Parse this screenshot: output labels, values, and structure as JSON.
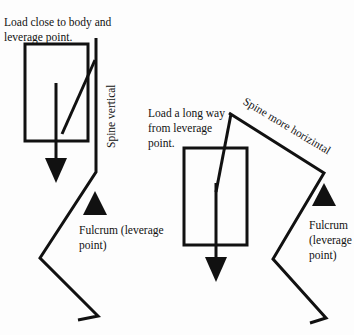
{
  "left_figure": {
    "load_label_line1": "Load close to body and",
    "load_label_line2": "leverage point.",
    "spine_label": "Spine vertical",
    "fulcrum_label_line1": "Fulcrum (leverage",
    "fulcrum_label_line2": "point)"
  },
  "right_figure": {
    "load_label_line1": "Load a long way",
    "load_label_line2": "from leverage",
    "load_label_line3": "point.",
    "spine_label": "Spine more horizintal",
    "fulcrum_label_line1": "Fulcrum",
    "fulcrum_label_line2": "(leverage",
    "fulcrum_label_line3": "point)"
  },
  "colors": {
    "ink": "#111111",
    "background": "#fdfdfd"
  }
}
